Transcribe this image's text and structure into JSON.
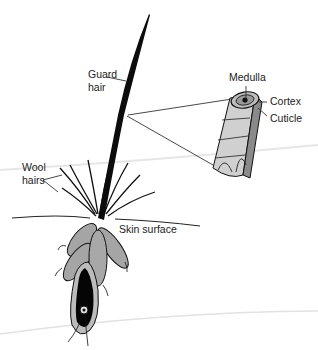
{
  "labels": {
    "guard_hair_line1": "Guard",
    "guard_hair_line2": "hair",
    "wool_hairs_line1": "Wool",
    "wool_hairs_line2": "hairs",
    "skin_surface": "Skin surface",
    "medulla": "Medulla",
    "cortex": "Cortex",
    "cuticle": "Cuticle"
  },
  "colors": {
    "ink": "#111111",
    "gland_fill": "#9a9a9a",
    "sheath": "#bdbdbd",
    "background": "#ffffff"
  }
}
